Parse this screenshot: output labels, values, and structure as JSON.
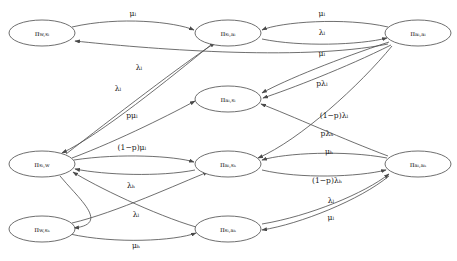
{
  "figure": {
    "kind": "state-transition-diagram",
    "title": "",
    "background_color": "#ffffff",
    "stroke_color": "#4a4a4a",
    "text_color": "#1a1a1a"
  },
  "nodes": [
    {
      "id": "w_sl",
      "label_main": "π",
      "label_sub": "w,s",
      "label_sub2": "l",
      "full": "π_{w,s_l}",
      "cx": 42,
      "cy": 33,
      "rx": 33,
      "ry": 13
    },
    {
      "id": "sl_al",
      "label_main": "π",
      "label_sub": "s",
      "label_sub2": "l",
      "full": "π_{s_l,a_l}",
      "cx": 228,
      "cy": 33,
      "rx": 33,
      "ry": 13
    },
    {
      "id": "al_al",
      "label_main": "π",
      "label_sub": "a",
      "label_sub2": "l",
      "full": "π_{a_l,a_l}",
      "cx": 418,
      "cy": 33,
      "rx": 33,
      "ry": 13
    },
    {
      "id": "al_sl",
      "label_main": "π",
      "label_sub": "a",
      "label_sub2": "l",
      "full": "π_{a_l,s_l}",
      "cx": 228,
      "cy": 99,
      "rx": 33,
      "ry": 13
    },
    {
      "id": "sl_w",
      "label_main": "π",
      "label_sub": "s",
      "label_sub2": "l",
      "full": "π_{s_l,w}",
      "cx": 42,
      "cy": 164,
      "rx": 33,
      "ry": 13
    },
    {
      "id": "al_sh",
      "label_main": "π",
      "label_sub": "a",
      "label_sub2": "l",
      "full": "π_{a_l,s_h}",
      "cx": 228,
      "cy": 164,
      "rx": 33,
      "ry": 13
    },
    {
      "id": "al_ah",
      "label_main": "π",
      "label_sub": "a",
      "label_sub2": "l",
      "full": "π_{a_l,a_h}",
      "cx": 418,
      "cy": 164,
      "rx": 33,
      "ry": 13
    },
    {
      "id": "w_sh",
      "label_main": "π",
      "label_sub": "w,s",
      "label_sub2": "h",
      "full": "π_{w,s_h}",
      "cx": 42,
      "cy": 229,
      "rx": 33,
      "ry": 13
    },
    {
      "id": "sl_ah",
      "label_main": "π",
      "label_sub": "s",
      "label_sub2": "l",
      "full": "π_{s_l,a_h}",
      "cx": 228,
      "cy": 229,
      "rx": 33,
      "ry": 13
    }
  ],
  "node_text": {
    "w_sl": {
      "pi": "π",
      "sub": "w,sₗ"
    },
    "sl_al": {
      "pi": "π",
      "sub": "sₗ,aₗ"
    },
    "al_al": {
      "pi": "π",
      "sub": "aₗ,aₗ"
    },
    "al_sl": {
      "pi": "π",
      "sub": "aₗ,sₗ"
    },
    "sl_w": {
      "pi": "π",
      "sub": "sₗ,w"
    },
    "al_sh": {
      "pi": "π",
      "sub": "aₗ,sₕ"
    },
    "al_ah": {
      "pi": "π",
      "sub": "aₗ,aₕ"
    },
    "w_sh": {
      "pi": "π",
      "sub": "w,sₕ"
    },
    "sl_ah": {
      "pi": "π",
      "sub": "sₗ,aₕ"
    }
  },
  "edges": [
    {
      "id": "e1",
      "from": "w_sl",
      "to": "sl_al",
      "label": "μₗ",
      "label_x": 133,
      "label_y": 14,
      "path": "M 72,27 C 120,16 175,22 194,30"
    },
    {
      "id": "e2",
      "from": "al_al",
      "to": "sl_al",
      "label": "μₗ",
      "label_x": 322,
      "label_y": 14,
      "path": "M 388,27 C 345,17 280,22 262,30"
    },
    {
      "id": "e3",
      "from": "sl_al",
      "to": "al_al",
      "label": "λₗ",
      "label_x": 322,
      "label_y": 33,
      "path": "M 262,39 C 300,47 360,45 387,38"
    },
    {
      "id": "e4",
      "from": "al_al",
      "to": "al_sl",
      "label": "μₗ",
      "label_x": 322,
      "label_y": 54,
      "path": "M 389,42 C 340,58 285,80 262,93"
    },
    {
      "id": "e5",
      "from": "al_al",
      "to": "al_sl",
      "label": "pλₗ",
      "label_x": 322,
      "label_y": 84,
      "path": "M 391,45 C 345,68 290,89 263,98"
    },
    {
      "id": "e6",
      "from": "al_al",
      "to": "al_sh",
      "label": "(1−p)λₗ",
      "label_x": 334,
      "label_y": 116,
      "path": "M 392,46 C 360,85 300,140 258,158"
    },
    {
      "id": "e7",
      "from": "al_ah",
      "to": "al_sl",
      "label": "pλₕ",
      "label_x": 327,
      "label_y": 134,
      "path": "M 388,156 C 345,140 290,115 261,104"
    },
    {
      "id": "e8",
      "from": "al_ah",
      "to": "al_sh",
      "label": "μₕ",
      "label_x": 329,
      "label_y": 152,
      "path": "M 387,158 C 345,150 285,153 262,160"
    },
    {
      "id": "e9",
      "from": "al_sh",
      "to": "al_ah",
      "label": "(1−p)λₕ",
      "label_x": 327,
      "label_y": 181,
      "path": "M 262,170 C 300,179 358,177 386,170"
    },
    {
      "id": "e10",
      "from": "sl_ah",
      "to": "al_ah",
      "label": "λₗ",
      "label_x": 331,
      "label_y": 201,
      "path": "M 262,224 C 310,216 365,193 389,174"
    },
    {
      "id": "e11",
      "from": "al_ah",
      "to": "sl_ah",
      "label": "μₗ",
      "label_x": 331,
      "label_y": 218,
      "path": "M 389,176 C 360,200 300,224 262,230"
    },
    {
      "id": "e12",
      "from": "al_al",
      "to": "w_sl",
      "label": "λₗ",
      "label_x": 139,
      "label_y": 68,
      "path": "M 388,44 C 300,62 140,48 75,41"
    },
    {
      "id": "e13",
      "from": "sl_w",
      "to": "sl_al",
      "label": "λₗ",
      "label_x": 118,
      "label_y": 89,
      "path": "M 66,154 C 110,120 185,62 215,43"
    },
    {
      "id": "e14",
      "from": "sl_w",
      "to": "al_sl",
      "label": "pμₗ",
      "label_x": 132,
      "label_y": 116,
      "path": "M 72,158 C 120,140 175,112 195,101"
    },
    {
      "id": "e15",
      "from": "sl_al",
      "to": "sl_w",
      "label": "",
      "label_x": 0,
      "label_y": 0,
      "path": "M 212,44 C 170,78 100,135 62,153"
    },
    {
      "id": "e16",
      "from": "sl_w",
      "to": "al_sh",
      "label": "(1−p)μₗ",
      "label_x": 132,
      "label_y": 148,
      "path": "M 74,160 C 120,153 175,156 194,162"
    },
    {
      "id": "e17",
      "from": "al_sh",
      "to": "sl_w",
      "label": "",
      "label_x": 0,
      "label_y": 0,
      "path": "M 195,170 C 160,177 105,175 75,169"
    },
    {
      "id": "e18",
      "from": "sl_ah",
      "to": "sl_w",
      "label": "λₕ",
      "label_x": 131,
      "label_y": 186,
      "path": "M 196,227 C 155,215 95,186 73,172"
    },
    {
      "id": "e19",
      "from": "w_sh",
      "to": "al_sh",
      "label": "λₗ",
      "label_x": 136,
      "label_y": 215,
      "path": "M 72,223 C 115,213 180,183 208,172"
    },
    {
      "id": "e20",
      "from": "w_sh",
      "to": "sl_ah",
      "label": "μₕ",
      "label_x": 136,
      "label_y": 246,
      "path": "M 70,234 C 115,244 175,241 196,233"
    },
    {
      "id": "e21",
      "from": "sl_w",
      "to": "w_sh",
      "label": "",
      "label_x": 0,
      "label_y": 0,
      "path": "M 60,176 C 80,200 110,224 74,228"
    }
  ],
  "edge_label_list": [
    "μₗ",
    "μₗ",
    "λₗ",
    "μₗ",
    "pλₗ",
    "(1−p)λₗ",
    "pλₕ",
    "μₕ",
    "(1−p)λₕ",
    "λₗ",
    "μₗ",
    "λₗ",
    "λₗ",
    "pμₗ",
    "(1−p)μₗ",
    "λₕ",
    "λₗ",
    "μₕ"
  ]
}
